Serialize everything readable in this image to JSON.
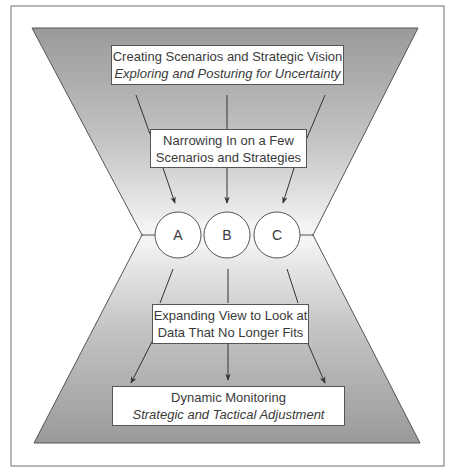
{
  "diagram": {
    "type": "hourglass-flow",
    "top_box": {
      "title": "Creating Scenarios and Strategic Vision",
      "subtitle": "Exploring and Posturing for Uncertainty"
    },
    "narrow_box": {
      "line1": "Narrowing In on a Few",
      "line2": "Scenarios and Strategies"
    },
    "scenarios": [
      "A",
      "B",
      "C"
    ],
    "expand_box": {
      "line1": "Expanding View to Look at",
      "line2": "Data That No Longer Fits"
    },
    "bottom_box": {
      "title": "Dynamic Monitoring",
      "subtitle": "Strategic and Tactical Adjustment"
    },
    "colors": {
      "funnel_dark": "#9a9a9a",
      "funnel_light": "#ffffff",
      "line": "#444444",
      "frame": "#888888"
    }
  }
}
